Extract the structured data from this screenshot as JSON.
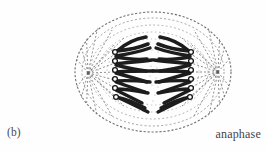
{
  "figure": {
    "caption_label": "(b)",
    "phase_label": "anaphase",
    "style": "stippled line drawing",
    "background_color": "#fefefe",
    "ink_color": "#2b2b2b",
    "chromosome_color": "#1d1d1d",
    "spindle_color": "#777777",
    "membrane_color": "#8a8a8a",
    "cell": {
      "center_x": 153,
      "center_y": 72,
      "radius_x": 78,
      "radius_y": 60,
      "contour_count": 5
    },
    "poles": [
      {
        "name": "left-pole",
        "x": 88,
        "y": 73
      },
      {
        "name": "right-pole",
        "x": 218,
        "y": 72
      }
    ],
    "kinetochores": {
      "left_column_x": 115,
      "right_column_x": 191,
      "count_per_side": 6,
      "y_positions": [
        54,
        63,
        72,
        80,
        88,
        96
      ],
      "radius": 2.4
    },
    "chromosomes": {
      "left_group_count": 7,
      "right_group_count": 7,
      "shape": "v-shaped-bent-arms",
      "note": "sister chromatids separated, migrating toward opposite poles"
    },
    "spindle_fibers": {
      "per_pole": 17,
      "dash_pattern": "2 2"
    }
  }
}
